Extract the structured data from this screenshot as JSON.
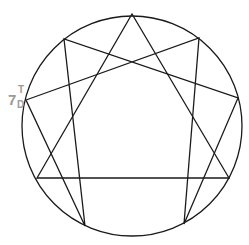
{
  "diagram": {
    "type": "enneagram",
    "circle": {
      "cx": 132,
      "cy": 126,
      "r": 110
    },
    "stroke_color": "#1a1a1a",
    "points": [
      {
        "id": "p9",
        "x": 132,
        "y": 14
      },
      {
        "id": "p1",
        "x": 199,
        "y": 38
      },
      {
        "id": "p2",
        "x": 238,
        "y": 98
      },
      {
        "id": "p3",
        "x": 229,
        "y": 178
      },
      {
        "id": "p4",
        "x": 184,
        "y": 224
      },
      {
        "id": "p5",
        "x": 85,
        "y": 226
      },
      {
        "id": "p6",
        "x": 37,
        "y": 178
      },
      {
        "id": "p7",
        "x": 26,
        "y": 100
      },
      {
        "id": "p8",
        "x": 64,
        "y": 39
      }
    ],
    "triangle": "132,14 229,178 37,178",
    "hexad": "199,38 184,224 238,98 64,39 85,226 26,100",
    "label": {
      "main": "7",
      "superscript": "T",
      "subscript": "D",
      "color": "#9a9a9a"
    }
  }
}
